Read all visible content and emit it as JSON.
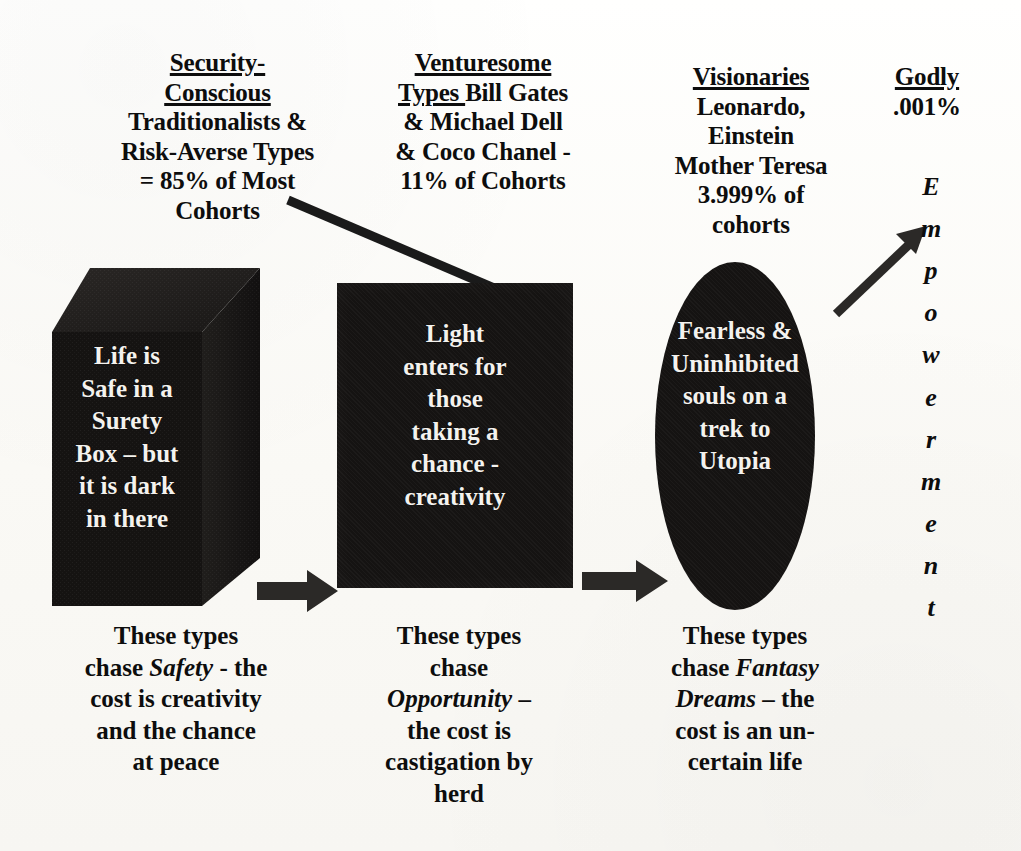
{
  "diagram": {
    "background_color": "#fbfaf7",
    "shape_color": "#151312",
    "text_color": "#0d0d0d",
    "shape_text_color": "#f4f2ee"
  },
  "headers": [
    {
      "id": "security-conscious",
      "underlined": [
        "Security-",
        "Conscious"
      ],
      "lines": [
        "Traditionalists &",
        "Risk-Averse Types",
        "= 85% of Most",
        "Cohorts"
      ]
    },
    {
      "id": "venturesome",
      "underlined": [
        "Venturesome",
        "Types "
      ],
      "inline_after_underline": "Bill Gates",
      "lines": [
        "& Michael Dell",
        "& Coco Chanel -",
        "11% of Cohorts"
      ]
    },
    {
      "id": "visionaries",
      "underlined": [
        "Visionaries"
      ],
      "lines": [
        "Leonardo,",
        "Einstein",
        "Mother Teresa",
        "3.999% of",
        "cohorts"
      ]
    },
    {
      "id": "godly",
      "underlined": [
        "Godly"
      ],
      "lines": [
        ".001%"
      ]
    }
  ],
  "shapes": {
    "cube": {
      "name": "surety-box",
      "lines": [
        "Life is",
        "Safe in a",
        "Surety",
        "Box – but",
        "it is dark",
        "in there"
      ]
    },
    "rectangle": {
      "name": "opportunity-box",
      "lines": [
        "Light",
        "enters for",
        "those",
        "taking a",
        "chance -",
        "creativity"
      ]
    },
    "ellipse": {
      "name": "visionary-oval",
      "lines": [
        "Fearless &",
        "Uninhibited",
        "souls on a",
        "trek to",
        "Utopia"
      ]
    }
  },
  "captions": [
    {
      "id": "safety-caption",
      "segments": [
        {
          "text": "These types",
          "italic": false
        },
        {
          "text": "chase ",
          "italic": false
        },
        {
          "text": "Safety",
          "italic": true
        },
        {
          "text": " - the",
          "italic": false
        },
        {
          "text": "cost is creativity",
          "italic": false
        },
        {
          "text": "and the chance",
          "italic": false
        },
        {
          "text": "at peace",
          "italic": false
        }
      ],
      "plain": "These types chase Safety - the cost is creativity and the chance at peace"
    },
    {
      "id": "opportunity-caption",
      "segments": [
        {
          "text": "These types",
          "italic": false
        },
        {
          "text": "chase",
          "italic": false
        },
        {
          "text": "Opportunity",
          "italic": true
        },
        {
          "text": " –",
          "italic": false
        },
        {
          "text": "the cost is",
          "italic": false
        },
        {
          "text": "castigation by",
          "italic": false
        },
        {
          "text": "herd",
          "italic": false
        }
      ],
      "plain": "These types chase Opportunity – the cost is castigation by herd"
    },
    {
      "id": "fantasy-caption",
      "segments": [
        {
          "text": "These types",
          "italic": false
        },
        {
          "text": "chase ",
          "italic": false
        },
        {
          "text": "Fantasy",
          "italic": true
        },
        {
          "text": "Dreams",
          "italic": true
        },
        {
          "text": " – the",
          "italic": false
        },
        {
          "text": "cost is an un-",
          "italic": false
        },
        {
          "text": "certain life",
          "italic": false
        }
      ],
      "plain": "These types chase Fantasy Dreams – the cost is an uncertain life"
    }
  ],
  "empowerment": {
    "word": "Empowerment",
    "letters": [
      "E",
      "m",
      "p",
      "o",
      "w",
      "e",
      "r",
      "m",
      "e",
      "n",
      "t"
    ]
  },
  "connectors": [
    {
      "id": "line-cohorts-to-rect",
      "type": "plain-line",
      "from": "security-conscious-header",
      "to": "opportunity-box"
    },
    {
      "id": "arrow-cube-to-rect",
      "type": "block-arrow",
      "direction": "right"
    },
    {
      "id": "arrow-rect-to-ellipse",
      "type": "block-arrow",
      "direction": "right"
    },
    {
      "id": "arrow-ellipse-to-empowerment",
      "type": "line-arrow",
      "direction": "up-right"
    }
  ]
}
